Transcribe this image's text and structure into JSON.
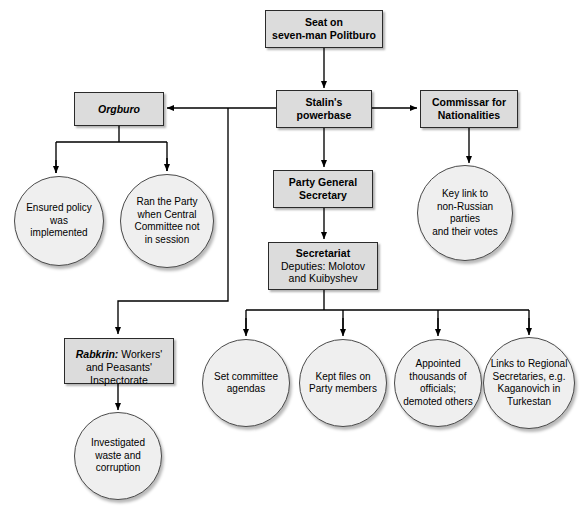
{
  "diagram": {
    "colors": {
      "box_fill": "#dcdcdc",
      "box_border": "#2b2b2b",
      "circle_fill": "#efefef",
      "circle_border": "#4a4a4a",
      "line": "#000000",
      "background": "#ffffff"
    },
    "boxes": [
      {
        "id": "politburo",
        "label": "Seat on\nseven-man Politburo",
        "bold": true,
        "x": 265,
        "y": 10,
        "w": 118,
        "h": 38
      },
      {
        "id": "powerbase",
        "label": "Stalin's\npowerbase",
        "bold": true,
        "x": 276,
        "y": 90,
        "w": 96,
        "h": 38
      },
      {
        "id": "orgburo",
        "label": "Orgburo",
        "bold": true,
        "italic": true,
        "x": 74,
        "y": 92,
        "w": 90,
        "h": 34
      },
      {
        "id": "commissar",
        "label": "Commissar for\nNationalities",
        "bold": true,
        "x": 420,
        "y": 90,
        "w": 98,
        "h": 38
      },
      {
        "id": "gensec",
        "label": "Party General\nSecretary",
        "bold": true,
        "x": 273,
        "y": 170,
        "w": 100,
        "h": 38
      },
      {
        "id": "secretariat",
        "label_bold": "Secretariat",
        "label_sub": "Deputies: Molotov\nand Kuibyshev",
        "x": 268,
        "y": 242,
        "w": 110,
        "h": 48
      },
      {
        "id": "rabkrin",
        "label_bold": "Rabkrin:",
        "label_sub": " Workers'\nand Peasants'\nInspectorate",
        "x": 64,
        "y": 338,
        "w": 110,
        "h": 46
      }
    ],
    "circles": [
      {
        "id": "ensured-policy",
        "label": "Ensured policy was\nimplemented",
        "cx": 59,
        "cy": 221,
        "r": 45
      },
      {
        "id": "ran-party",
        "label": "Ran the Party\nwhen Central\nCommittee not\nin session",
        "cx": 167,
        "cy": 221,
        "r": 47
      },
      {
        "id": "key-link",
        "label": "Key link to\nnon-Russian parties\nand their votes",
        "cx": 465,
        "cy": 213,
        "r": 48
      },
      {
        "id": "investigated-waste",
        "label": "Investigated\nwaste and\ncorruption",
        "cx": 118,
        "cy": 456,
        "r": 44
      },
      {
        "id": "set-agendas",
        "label": "Set committee\nagendas",
        "cx": 246,
        "cy": 383,
        "r": 44
      },
      {
        "id": "kept-files",
        "label": "Kept files on\nParty members",
        "cx": 343,
        "cy": 383,
        "r": 44
      },
      {
        "id": "appointed",
        "label": "Appointed\nthousands of\nofficials;\ndemoted others",
        "cx": 438,
        "cy": 383,
        "r": 44
      },
      {
        "id": "regional-secs",
        "label": "Links to Regional\nSecretaries, e.g.\nKaganovich in\nTurkestan",
        "cx": 529,
        "cy": 383,
        "r": 46
      }
    ]
  }
}
